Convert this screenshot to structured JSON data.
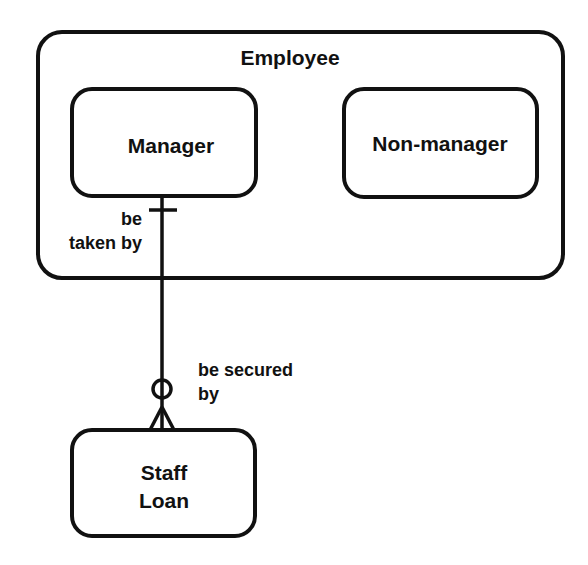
{
  "diagram": {
    "type": "entity-relationship",
    "colors": {
      "stroke": "#111111",
      "background": "#ffffff"
    },
    "supertype": {
      "name": "Employee",
      "subtypes": [
        {
          "name": "Manager"
        },
        {
          "name": "Non-manager"
        }
      ]
    },
    "entities": [
      {
        "name": "Staff Loan",
        "lines": [
          "Staff",
          "Loan"
        ]
      }
    ],
    "relationship": {
      "from": "Manager",
      "to": "Staff Loan",
      "from_label_lines": [
        "be",
        "taken by"
      ],
      "to_label_lines": [
        "be secured",
        "by"
      ],
      "from_cardinality": "exactly-one",
      "to_cardinality": "zero-or-many"
    }
  }
}
